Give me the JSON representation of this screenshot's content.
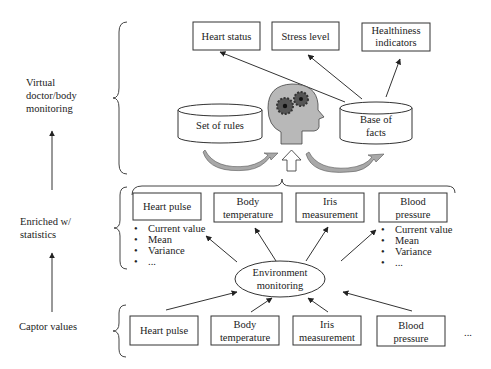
{
  "side_labels": {
    "level3": [
      "Virtual",
      "doctor/body",
      "monitoring"
    ],
    "level2": [
      "Enriched w/",
      "statistics"
    ],
    "level1": [
      "Captor values"
    ]
  },
  "outputs": {
    "heart_status": "Heart status",
    "stress_level": "Stress level",
    "healthiness": [
      "Healthiness",
      "indicators"
    ]
  },
  "knowledge": {
    "rules": "Set of rules",
    "facts": [
      "Base of",
      "facts"
    ]
  },
  "enriched": {
    "heart_pulse": "Heart pulse",
    "body_temperature": [
      "Body",
      "temperature"
    ],
    "iris": [
      "Iris",
      "measurement"
    ],
    "blood_pressure": [
      "Blood",
      "pressure"
    ],
    "stats_left": [
      "Current value",
      "Mean",
      "Variance",
      "..."
    ],
    "stats_right": [
      "Current value",
      "Mean",
      "Variance",
      "..."
    ]
  },
  "environment": [
    "Environment",
    "monitoring"
  ],
  "captors": {
    "heart_pulse": "Heart pulse",
    "body_temperature": [
      "Body",
      "temperature"
    ],
    "iris": [
      "Iris",
      "measurement"
    ],
    "blood_pressure": [
      "Blood",
      "pressure"
    ],
    "more": "..."
  },
  "colors": {
    "head_fill": "#b8b8b8",
    "gear_fill": "#555555",
    "curved_arrow_fill": "#a8a8a8"
  }
}
